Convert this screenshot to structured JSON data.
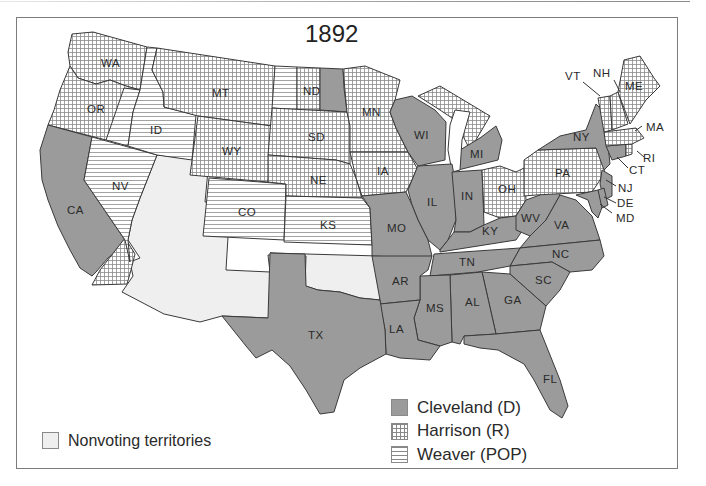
{
  "map": {
    "title": "1892",
    "subject": "United States presidential election results by state",
    "colors": {
      "cleveland_fill": "#9b9b9b",
      "harrison_pattern": "grid-hatch",
      "weaver_pattern": "horizontal-hatch",
      "nonvoting_fill": "#efefef",
      "border": "#3a3a3a"
    },
    "legend": {
      "parties": [
        {
          "label": "Cleveland (D)",
          "pattern": "solid-gray"
        },
        {
          "label": "Harrison (R)",
          "pattern": "grid"
        },
        {
          "label": "Weaver (POP)",
          "pattern": "horizontal-lines"
        }
      ],
      "nonvoting": {
        "label": "Nonvoting territories",
        "pattern": "light-gray"
      }
    },
    "states": [
      {
        "abbr": "WA",
        "winner": "Harrison (R)"
      },
      {
        "abbr": "OR",
        "winner": "Harrison (R)",
        "note": "split with Weaver (POP)"
      },
      {
        "abbr": "CA",
        "winner": "Cleveland (D)",
        "note": "split with Harrison (R)"
      },
      {
        "abbr": "ID",
        "winner": "Weaver (POP)"
      },
      {
        "abbr": "NV",
        "winner": "Weaver (POP)"
      },
      {
        "abbr": "MT",
        "winner": "Harrison (R)"
      },
      {
        "abbr": "WY",
        "winner": "Harrison (R)"
      },
      {
        "abbr": "CO",
        "winner": "Weaver (POP)"
      },
      {
        "abbr": "ND",
        "winner": "split",
        "note": "Weaver (POP), Harrison (R), Cleveland (D)"
      },
      {
        "abbr": "SD",
        "winner": "Harrison (R)"
      },
      {
        "abbr": "NE",
        "winner": "Harrison (R)"
      },
      {
        "abbr": "KS",
        "winner": "Weaver (POP)"
      },
      {
        "abbr": "MN",
        "winner": "Harrison (R)"
      },
      {
        "abbr": "IA",
        "winner": "Harrison (R)"
      },
      {
        "abbr": "MO",
        "winner": "Cleveland (D)"
      },
      {
        "abbr": "AR",
        "winner": "Cleveland (D)"
      },
      {
        "abbr": "LA",
        "winner": "Cleveland (D)"
      },
      {
        "abbr": "TX",
        "winner": "Cleveland (D)"
      },
      {
        "abbr": "WI",
        "winner": "Cleveland (D)"
      },
      {
        "abbr": "IL",
        "winner": "Cleveland (D)"
      },
      {
        "abbr": "MI",
        "winner": "split",
        "note": "Harrison (R) and Cleveland (D)"
      },
      {
        "abbr": "IN",
        "winner": "Cleveland (D)"
      },
      {
        "abbr": "OH",
        "winner": "Harrison (R)"
      },
      {
        "abbr": "KY",
        "winner": "Cleveland (D)"
      },
      {
        "abbr": "TN",
        "winner": "Cleveland (D)"
      },
      {
        "abbr": "MS",
        "winner": "Cleveland (D)"
      },
      {
        "abbr": "AL",
        "winner": "Cleveland (D)"
      },
      {
        "abbr": "GA",
        "winner": "Cleveland (D)"
      },
      {
        "abbr": "FL",
        "winner": "Cleveland (D)"
      },
      {
        "abbr": "SC",
        "winner": "Cleveland (D)"
      },
      {
        "abbr": "NC",
        "winner": "Cleveland (D)"
      },
      {
        "abbr": "VA",
        "winner": "Cleveland (D)"
      },
      {
        "abbr": "WV",
        "winner": "Cleveland (D)"
      },
      {
        "abbr": "PA",
        "winner": "Harrison (R)"
      },
      {
        "abbr": "NY",
        "winner": "Cleveland (D)"
      },
      {
        "abbr": "NJ",
        "winner": "Cleveland (D)"
      },
      {
        "abbr": "DE",
        "winner": "Cleveland (D)"
      },
      {
        "abbr": "MD",
        "winner": "Cleveland (D)"
      },
      {
        "abbr": "CT",
        "winner": "Cleveland (D)"
      },
      {
        "abbr": "RI",
        "winner": "Harrison (R)"
      },
      {
        "abbr": "MA",
        "winner": "Harrison (R)"
      },
      {
        "abbr": "VT",
        "winner": "Harrison (R)"
      },
      {
        "abbr": "NH",
        "winner": "Harrison (R)"
      },
      {
        "abbr": "ME",
        "winner": "Harrison (R)"
      }
    ],
    "nonvoting_regions": [
      "Utah Territory",
      "New Mexico Territory",
      "Arizona Territory",
      "Oklahoma Territory / Indian Territory"
    ]
  }
}
